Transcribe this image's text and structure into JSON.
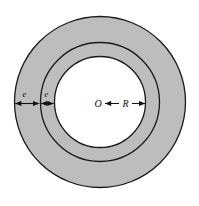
{
  "figure": {
    "kind": "annulus-cross-section-diagram",
    "background_color": "#ffffff",
    "ring_fill_color": "#bdbdbd",
    "inner_fill_color": "#ffffff",
    "stroke_color": "#1a1a1a",
    "center": {
      "x": 100,
      "y": 102,
      "label": "O"
    },
    "circles": [
      {
        "name": "outer-circle",
        "radius": 86,
        "fill": "#bdbdbd"
      },
      {
        "name": "middle-circle",
        "radius": 60,
        "fill": "#bdbdbd"
      },
      {
        "name": "inner-circle",
        "radius": 46,
        "fill": "#ffffff"
      }
    ],
    "labels": {
      "center_point": "O",
      "radius": "R",
      "thickness_outer": "e",
      "thickness_inner": "e"
    },
    "dimensions": [
      {
        "name": "outer-ring-thickness",
        "label": "e",
        "from_x": 14,
        "to_x": 40,
        "y": 103,
        "arrow_style": "double-headed"
      },
      {
        "name": "inner-ring-thickness",
        "label": "e",
        "from_x": 40,
        "to_x": 54,
        "y": 103,
        "arrow_style": "double-headed"
      },
      {
        "name": "inner-radius",
        "label": "R",
        "from_x": 104,
        "to_x": 146,
        "y": 103,
        "arrow_style": "double-headed"
      }
    ]
  }
}
